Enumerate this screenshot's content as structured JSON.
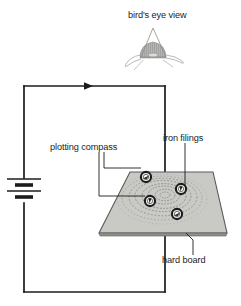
{
  "figure": {
    "title_note": "bird's eye view",
    "type": "physics-diagram",
    "background_color": "#ffffff",
    "ink_color": "#1c1c1c"
  },
  "labels": {
    "birds_eye_view": "bird's eye view",
    "plotting_compass": "plotting compass",
    "iron_filings": "iron filings",
    "hard_board": "hard board"
  },
  "circuit": {
    "wire_color": "#1c1c1c",
    "current_arrow_direction": "right",
    "battery": {
      "name": "battery",
      "cells": 2,
      "orientation": "vertical"
    },
    "loop": {
      "left_x": 24,
      "right_x": 165,
      "top_y": 86,
      "bottom_y": 292
    }
  },
  "board": {
    "name": "hard board",
    "shape": "trapezoid-perspective",
    "fill_color": "#c9c9c6",
    "edge_color": "#5a5a58"
  },
  "field_pattern": {
    "name": "iron filings",
    "shape": "concentric-rings",
    "ring_count": 7,
    "color": "#8d8d8a"
  },
  "compasses": [
    {
      "id": "compass-1",
      "label": "plotting compass",
      "cx": 146,
      "cy": 177,
      "needle_angle": 20
    },
    {
      "id": "compass-2",
      "label": "plotting compass",
      "cx": 181,
      "cy": 189,
      "needle_angle": 95
    },
    {
      "id": "compass-3",
      "label": "plotting compass",
      "cx": 150,
      "cy": 201,
      "needle_angle": 100
    },
    {
      "id": "compass-4",
      "label": "plotting compass",
      "cx": 177,
      "cy": 214,
      "needle_angle": 30
    }
  ],
  "bird_sketch": {
    "name": "bird-sketch",
    "fill_color": "#8a8a87"
  }
}
